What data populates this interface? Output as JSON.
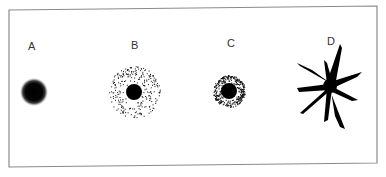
{
  "figure": {
    "panels": [
      {
        "label": "A",
        "type": "blurred-dot",
        "cx": 34,
        "cy": 92,
        "core_r": 9,
        "halo_r": 13,
        "label_x": 32,
        "label_y": 50
      },
      {
        "label": "B",
        "type": "dot-with-sparse-speckle-halo",
        "cx": 134,
        "cy": 92,
        "core_r": 8,
        "halo_r": 26,
        "label_x": 135,
        "label_y": 49
      },
      {
        "label": "C",
        "type": "dot-with-dense-speckle-halo",
        "cx": 229,
        "cy": 91,
        "core_r": 8,
        "halo_r": 16,
        "label_x": 231,
        "label_y": 47
      },
      {
        "label": "D",
        "type": "star-burst",
        "cx": 330,
        "cy": 86,
        "label_x": 331,
        "label_y": 45
      }
    ],
    "colors": {
      "ink": "#000000",
      "border": "#8a8a8a",
      "label": "#333333",
      "background": "#ffffff"
    }
  }
}
